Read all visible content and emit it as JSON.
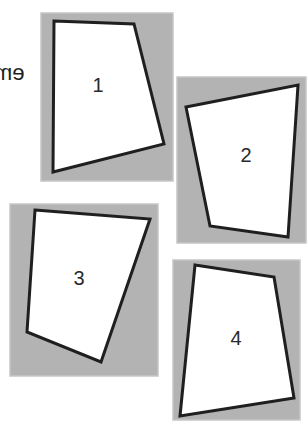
{
  "cut_text": "em",
  "colors": {
    "panel": "#b3b3b3",
    "panel_edge": "#c6c6c6",
    "shape_fill": "#ffffff",
    "shape_stroke": "#1f1f1f",
    "label": "#2a2a2a",
    "background": "#ffffff"
  },
  "panels": [
    {
      "id": "1",
      "label": "1",
      "rect": {
        "x": 41,
        "y": 13,
        "w": 132,
        "h": 168
      },
      "quad": [
        [
          54,
          21
        ],
        [
          134,
          24
        ],
        [
          164,
          144
        ],
        [
          53,
          172
        ]
      ],
      "label_pos": [
        98,
        87
      ]
    },
    {
      "id": "2",
      "label": "2",
      "rect": {
        "x": 177,
        "y": 77,
        "w": 129,
        "h": 166
      },
      "quad": [
        [
          186,
          107
        ],
        [
          298,
          85
        ],
        [
          288,
          237
        ],
        [
          210,
          226
        ]
      ],
      "label_pos": [
        246,
        157
      ]
    },
    {
      "id": "3",
      "label": "3",
      "rect": {
        "x": 10,
        "y": 204,
        "w": 148,
        "h": 172
      },
      "quad": [
        [
          35,
          210
        ],
        [
          150,
          219
        ],
        [
          101,
          362
        ],
        [
          27,
          332
        ]
      ],
      "label_pos": [
        79,
        280
      ]
    },
    {
      "id": "4",
      "label": "4",
      "rect": {
        "x": 173,
        "y": 260,
        "w": 127,
        "h": 160
      },
      "quad": [
        [
          195,
          265
        ],
        [
          274,
          277
        ],
        [
          294,
          398
        ],
        [
          180,
          416
        ]
      ],
      "label_pos": [
        236,
        340
      ]
    }
  ]
}
